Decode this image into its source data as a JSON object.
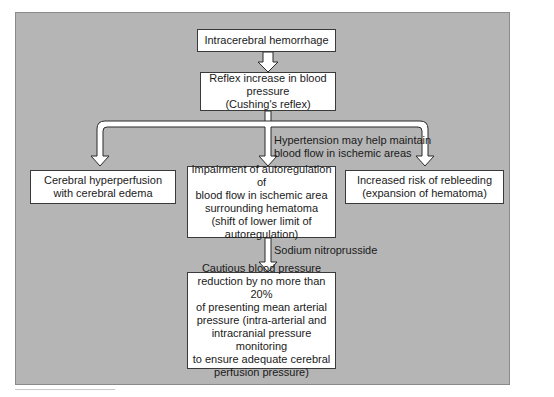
{
  "diagram": {
    "type": "flowchart",
    "background_color": "#b5b5b5",
    "box_color": "#ffffff",
    "nodes": {
      "start": {
        "text": "Intracerebral hemorrhage"
      },
      "reflex": {
        "text": "Reflex increase in blood pressure\n(Cushing's reflex)"
      },
      "hyperperfusion": {
        "text": "Cerebral hyperperfusion\nwith cerebral edema"
      },
      "impairment": {
        "text": "Impairment of autoregulation of\nblood flow in ischemic area\nsurrounding hematoma\n(shift of lower limit of\nautoregulation)"
      },
      "rebleeding": {
        "text": "Increased risk of rebleeding\n(expansion of hematoma)"
      },
      "reduction": {
        "text": "Cautious blood pressure\nreduction by no more than 20%\nof presenting mean arterial\npressure (intra-arterial  and\nintracranial pressure monitoring\nto ensure adequate cerebral\nperfusion pressure)"
      }
    },
    "edge_labels": {
      "hypertension": "Hypertension may help maintain\nblood flow in ischemic areas",
      "nitroprusside": "Sodium nitroprusside"
    },
    "edges": [
      {
        "from": "start",
        "to": "reflex"
      },
      {
        "from": "reflex",
        "to": "hyperperfusion"
      },
      {
        "from": "reflex",
        "to": "impairment",
        "label": "hypertension"
      },
      {
        "from": "reflex",
        "to": "rebleeding"
      },
      {
        "from": "impairment",
        "to": "reduction",
        "label": "nitroprusside"
      }
    ]
  }
}
